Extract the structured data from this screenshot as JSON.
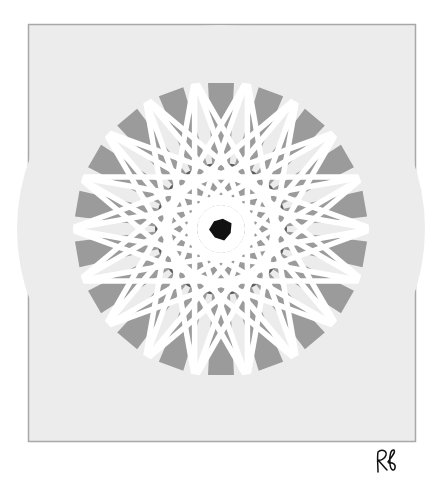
{
  "artwork": {
    "type": "geometric rosette / starburst",
    "spoke_count": 18,
    "spoke_angle_step_deg": 20,
    "center": [
      221,
      229
    ],
    "outer_radius": 146,
    "frame": {
      "x": 28,
      "y": 24,
      "width": 388,
      "height": 418
    },
    "colors": {
      "page_background": "#ffffff",
      "frame_fill": "#ececec",
      "frame_border": "#a8a8a8",
      "spoke_gray": "#9b9b9b",
      "inner_dark_gray": "#5e5e5e",
      "line_white": "#ffffff",
      "center_black": "#111111"
    }
  },
  "signature": {
    "text": "Rf"
  }
}
